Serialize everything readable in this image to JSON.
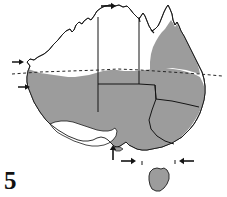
{
  "figure": {
    "number_label": "5",
    "caption_visible": false,
    "background_color": "#ffffff"
  },
  "map": {
    "region_name": "Australia",
    "outline_color": "#1a1a1a",
    "shaded_fill_color": "#9c9c9c",
    "unshaded_fill_color": "#ffffff",
    "border_color": "#141414",
    "latitude_line": {
      "name": "tropic-of-capricorn",
      "style": "dashed",
      "color": "#262626"
    },
    "shaded_regions": [
      "south-west-western-australia",
      "southern-northern-territory",
      "south-australia",
      "queensland-east",
      "new-south-wales",
      "victoria",
      "tasmania"
    ],
    "unshaded_regions": [
      "north-west-western-australia",
      "top-end-northern-territory",
      "cape-york-north"
    ],
    "state_borders": [
      "wa-nt-sa-vertical-west",
      "nt-qld-vertical-east",
      "nt-sa-horizontal",
      "sa-nsw-qld-horizontal",
      "sa-vic-nsw-vertical",
      "nsw-vic-diagonal"
    ],
    "islands": [
      "tasmania",
      "kangaroo-island"
    ]
  },
  "annotations": {
    "arrows": [
      {
        "id": "arrow-north-coast",
        "direction": "right",
        "x": 107,
        "y": 6
      },
      {
        "id": "arrow-west-coast-a",
        "direction": "right",
        "x": 17,
        "y": 62
      },
      {
        "id": "arrow-west-coast-b",
        "direction": "right",
        "x": 24,
        "y": 87
      },
      {
        "id": "arrow-south-coast-up",
        "direction": "up",
        "x": 113,
        "y": 152
      },
      {
        "id": "arrow-southeast-left",
        "direction": "right",
        "x": 128,
        "y": 161
      },
      {
        "id": "arrow-southeast-right",
        "direction": "left",
        "x": 188,
        "y": 161
      }
    ],
    "tick_marks": [
      {
        "id": "tick-gulf",
        "x": 139,
        "y": 19
      },
      {
        "id": "tick-cape",
        "x": 152,
        "y": 32
      },
      {
        "id": "tick-bight",
        "x": 142,
        "y": 163
      },
      {
        "id": "tick-bass-strait",
        "x": 175,
        "y": 162
      }
    ]
  }
}
